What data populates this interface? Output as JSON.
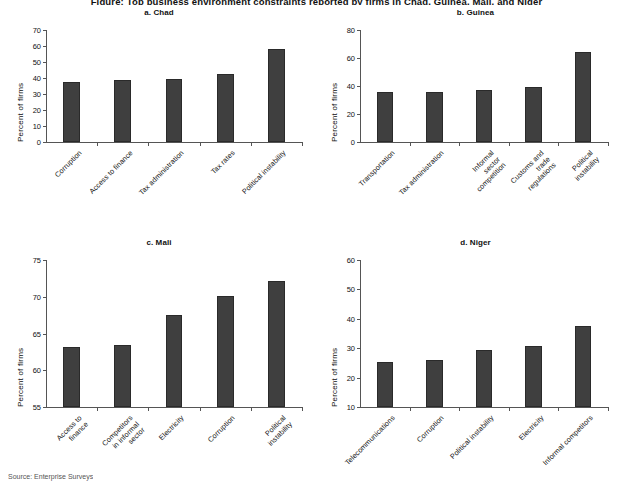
{
  "figure": {
    "title": "Figure: Top business environment constraints reported by firms in Chad, Guinea, Mali, and Niger",
    "source": "Source: Enterprise Surveys",
    "bar_color": "#3f3f3f",
    "axis_color": "#555555"
  },
  "chart_data": [
    {
      "type": "bar",
      "title": "a. Chad",
      "xlabel": "",
      "ylabel": "Percent of firms",
      "ylim": [
        0,
        70
      ],
      "yticks": [
        0,
        10,
        20,
        30,
        40,
        50,
        60,
        70
      ],
      "grid": false,
      "legend": "none",
      "categories": [
        "Corruption",
        "Access to finance",
        "Tax administration",
        "Tax rates",
        "Political instability"
      ],
      "values": [
        37.5,
        38.5,
        39.6,
        42.7,
        58.2
      ]
    },
    {
      "type": "bar",
      "title": "b. Guinea",
      "xlabel": "",
      "ylabel": "Percent of firms",
      "ylim": [
        0,
        80
      ],
      "yticks": [
        0,
        20,
        40,
        60,
        80
      ],
      "grid": false,
      "legend": "none",
      "categories": [
        "Transportation",
        "Tax administration",
        "Informal\nsector\ncompetition",
        "Customs and\ntrade\nregulations",
        "Political\ninstability"
      ],
      "values": [
        35.8,
        35.7,
        36.8,
        39.4,
        64.5
      ]
    },
    {
      "type": "bar",
      "title": "c. Mali",
      "xlabel": "",
      "ylabel": "Percent of firms",
      "ylim": [
        55,
        75
      ],
      "yticks": [
        55,
        60,
        65,
        70,
        75
      ],
      "grid": false,
      "legend": "none",
      "categories": [
        "Access to\nfinance",
        "Competitors\nin informal\nsector",
        "Electricity",
        "Corruption",
        "Political\ninstability"
      ],
      "values": [
        63.2,
        63.5,
        67.5,
        70.1,
        72.2
      ]
    },
    {
      "type": "bar",
      "title": "d. Niger",
      "xlabel": "",
      "ylabel": "Percent of firms",
      "ylim": [
        10,
        60
      ],
      "yticks": [
        10,
        20,
        30,
        40,
        50,
        60
      ],
      "grid": false,
      "legend": "none",
      "categories": [
        "Telecommunications",
        "Corruption",
        "Political instability",
        "Electricity",
        "Informal competitors"
      ],
      "values": [
        25.2,
        26.0,
        29.4,
        30.9,
        37.4
      ]
    }
  ]
}
